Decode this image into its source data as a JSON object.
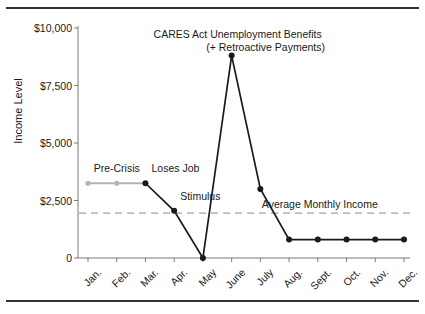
{
  "clipped_header_text": "",
  "chart_data": {
    "type": "line",
    "title": "",
    "xlabel": "",
    "ylabel": "Income Level",
    "categories": [
      "Jan.",
      "Feb.",
      "Mar.",
      "Apr.",
      "May",
      "June",
      "July",
      "Aug.",
      "Sept.",
      "Oct.",
      "Nov.",
      "Dec."
    ],
    "values": [
      3250,
      3250,
      3250,
      2050,
      0,
      8800,
      3000,
      800,
      800,
      800,
      800,
      800
    ],
    "ylim": [
      0,
      10000
    ],
    "yticks": [
      0,
      2500,
      5000,
      7500,
      10000
    ],
    "ytick_labels": [
      "0",
      "$2,500",
      "$5,000",
      "$7,500",
      "$10,000"
    ],
    "grid": false,
    "legend": "none",
    "series": [
      {
        "name": "Income Level",
        "values": [
          3250,
          3250,
          3250,
          2050,
          0,
          8800,
          3000,
          800,
          800,
          800,
          800,
          800
        ]
      }
    ],
    "segment_styles": [
      {
        "from": "Jan.",
        "to": "Mar.",
        "color": "#b4b4b4",
        "note": "pre-crisis period drawn in light gray"
      },
      {
        "from": "Mar.",
        "to": "Dec.",
        "color": "#1a1a1a",
        "note": "post job-loss period drawn in black"
      }
    ],
    "reference_lines": [
      {
        "label": "Average Monthly Income",
        "value": 1950,
        "style": "dashed",
        "color": "#bbbbbb",
        "orientation": "horizontal"
      }
    ],
    "annotations": [
      {
        "text": "Pre-Crisis",
        "x": "Feb.",
        "value": 3250,
        "anchor": "above"
      },
      {
        "text": "Loses Job",
        "x": "Mar.",
        "value": 3250,
        "anchor": "above-right"
      },
      {
        "text": "Stimulus",
        "x": "Apr.",
        "value": 2050,
        "anchor": "above-right"
      },
      {
        "text": "CARES Act Unemployment Benefits",
        "x": "June",
        "value": 8800,
        "anchor": "above"
      },
      {
        "text": "(+ Retroactive Payments)",
        "x": "June",
        "value": 8800,
        "anchor": "above-second-line"
      },
      {
        "text": "Average Monthly Income",
        "x": "Sept.",
        "value": 1950,
        "anchor": "above-reference-line"
      }
    ]
  }
}
